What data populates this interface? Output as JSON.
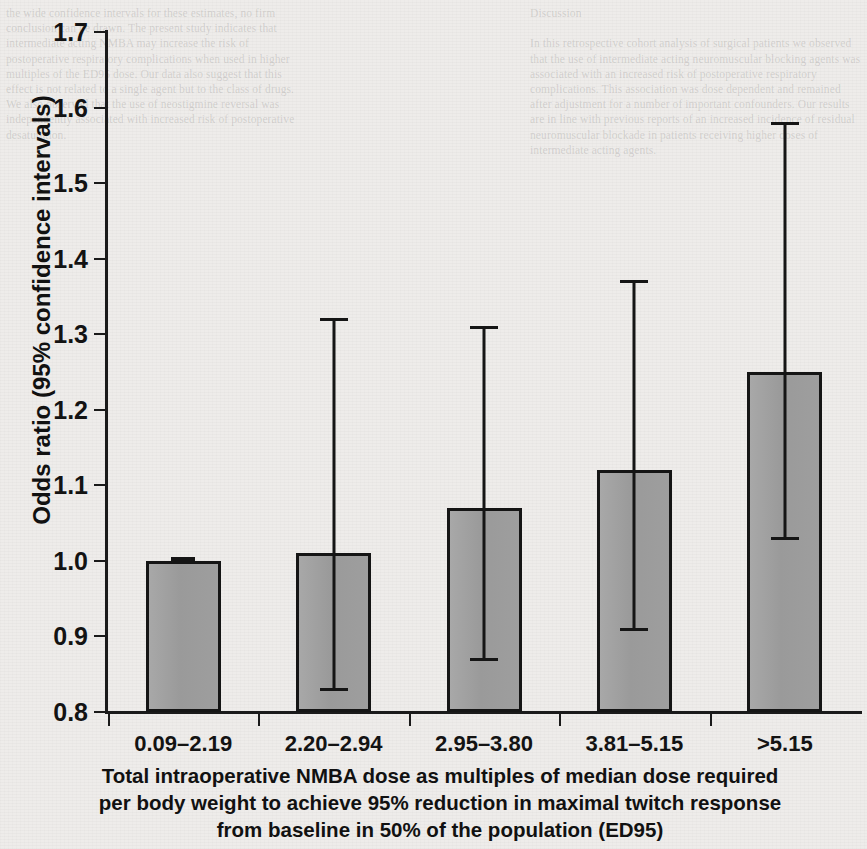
{
  "chart_data": {
    "type": "bar",
    "title": "",
    "xlabel": "Total intraoperative NMBA dose as multiples of median dose required per body weight to achieve 95% reduction in maximal twitch response from baseline in 50% of the population (ED95)",
    "ylabel": "Odds ratio (95% confidence intervals)",
    "categories": [
      "0.09–2.19",
      "2.20–2.94",
      "2.95–3.80",
      "3.81–5.15",
      ">5.15"
    ],
    "values": [
      1.0,
      1.01,
      1.07,
      1.12,
      1.25
    ],
    "ci_lower": [
      1.0,
      0.83,
      0.87,
      0.91,
      1.03
    ],
    "ci_upper": [
      1.0,
      1.32,
      1.31,
      1.37,
      1.58
    ],
    "reference_category": "0.09–2.19",
    "ylim": [
      0.8,
      1.7
    ],
    "ytick_labels": [
      "1.7",
      "1.6",
      "1.5",
      "1.4",
      "1.3",
      "1.2",
      "1.1",
      "1.0",
      "0.9",
      "0.8"
    ],
    "ytick_values": [
      1.7,
      1.6,
      1.5,
      1.4,
      1.3,
      1.2,
      1.1,
      1.0,
      0.9,
      0.8
    ],
    "grid": false,
    "legend": "none",
    "bar_color": "#9e9e9e",
    "bar_edge_color": "#151515",
    "error_bar_color": "#151515"
  },
  "axes": {
    "y_title": "Odds ratio (95% confidence intervals)",
    "x_caption_lines": [
      "Total intraoperative NMBA dose as multiples of median dose required",
      "per body weight to achieve 95% reduction in maximal twitch response",
      "from baseline in 50% of the population (ED95)"
    ]
  },
  "background": {
    "ghost_left": "the wide confidence intervals for these estimates, no firm conclusion can be drawn. The present study indicates that intermediate acting NMBA may increase the risk of postoperative respiratory complications when used in higher multiples of the ED95 dose. Our data also suggest that this effect is not related to a single agent but to the class of drugs. We also observed that the use of neostigmine reversal was independently associated with increased risk of postoperative desaturation.",
    "ghost_right": "Discussion\n\nIn this retrospective cohort analysis of surgical patients we observed that the use of intermediate acting neuromuscular blocking agents was associated with an increased risk of postoperative respiratory complications. This association was dose dependent and remained after adjustment for a number of important confounders. Our results are in line with previous reports of an increased incidence of residual neuromuscular blockade in patients receiving higher doses of intermediate acting agents."
  }
}
